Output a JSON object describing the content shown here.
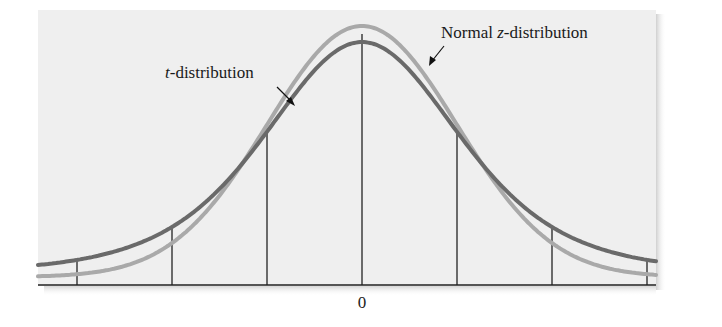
{
  "chart_data": {
    "type": "line",
    "title": "",
    "xlabel": "",
    "ylabel": "",
    "grid": false,
    "legend_position": "inline annotations with arrows",
    "x_ticks": [
      {
        "sd": -3,
        "label": ""
      },
      {
        "sd": -2,
        "label": ""
      },
      {
        "sd": -1,
        "label": ""
      },
      {
        "sd": 0,
        "label": "0"
      },
      {
        "sd": 1,
        "label": ""
      },
      {
        "sd": 2,
        "label": ""
      },
      {
        "sd": 3,
        "label": ""
      }
    ],
    "xlim": [
      -3.4,
      3.4
    ],
    "series": [
      {
        "name": "Normal z-distribution",
        "label_prefix": "Normal ",
        "label_italic": "z",
        "label_suffix": "-distribution",
        "kind": "standard normal",
        "peak_relative": 1.0,
        "color": "#a9a9a9"
      },
      {
        "name": "t-distribution",
        "label_prefix": "",
        "label_italic": "t",
        "label_suffix": "-distribution",
        "kind": "student t (low df, heavier tails)",
        "degrees_of_freedom_estimate": 5,
        "peak_relative": 0.92,
        "color": "#6a6a6a"
      }
    ],
    "annotations": [
      {
        "text": "t-distribution",
        "points_to": "t-distribution curve, left side"
      },
      {
        "text": "Normal z-distribution",
        "points_to": "normal curve, right side"
      }
    ]
  },
  "colors": {
    "panel_background": "#efefef",
    "axis": "#222222",
    "t_curve": "#6a6a6a",
    "normal_curve": "#a9a9a9"
  },
  "labels": {
    "zero": "0"
  }
}
